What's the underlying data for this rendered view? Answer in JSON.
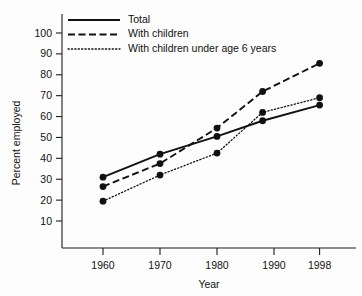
{
  "chart_data": {
    "type": "line",
    "title": "",
    "xlabel": "Year",
    "ylabel": "Percent employed",
    "x": [
      1960,
      1970,
      1980,
      1988,
      1998
    ],
    "xticks": [
      "1960",
      "1970",
      "1980",
      "1990",
      "1998"
    ],
    "xtick_values": [
      1960,
      1970,
      1980,
      1990,
      1998
    ],
    "yticks": [
      "10",
      "20",
      "30",
      "40",
      "50",
      "60",
      "70",
      "80",
      "90",
      "100"
    ],
    "ytick_values": [
      10,
      20,
      30,
      40,
      50,
      60,
      70,
      80,
      90,
      100
    ],
    "xlim": [
      1955,
      2002
    ],
    "ylim": [
      0,
      105
    ],
    "grid": false,
    "legend_position": "top-left",
    "series": [
      {
        "name": "Total",
        "style": "solid",
        "color": "#111111",
        "values": [
          31,
          42,
          50.5,
          58,
          65.5
        ]
      },
      {
        "name": "With children",
        "style": "dashed",
        "color": "#111111",
        "values": [
          26.5,
          37.5,
          54.5,
          72,
          85.5
        ]
      },
      {
        "name": "With children under age 6 years",
        "style": "dotted",
        "color": "#111111",
        "values": [
          19.5,
          32,
          42.5,
          62,
          69
        ]
      }
    ]
  },
  "legend": {
    "items": [
      {
        "label": "Total"
      },
      {
        "label": "With children"
      },
      {
        "label": "With children under age 6 years"
      }
    ]
  }
}
